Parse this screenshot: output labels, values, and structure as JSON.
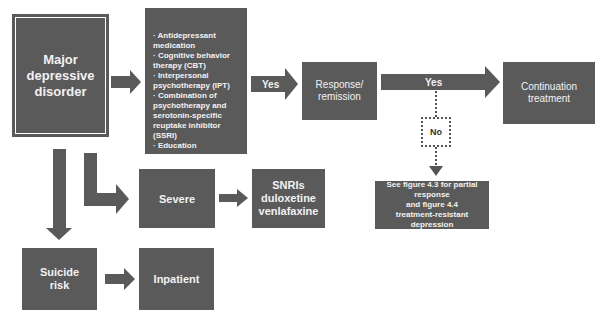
{
  "diagram": {
    "nodes": {
      "major_depressive_disorder": {
        "lines": [
          "Major",
          "depressive",
          "disorder"
        ]
      },
      "treatment_options": {
        "items": [
          "Antidepressant medication",
          "Cognitive behavior therapy (CBT)",
          "Interpersonal psychotherapy (IPT)",
          "Combination of psychotherapy and serotonin-specific reuptake inhibitor (SSRI)",
          "Education"
        ]
      },
      "response_remission": {
        "lines": [
          "Response/",
          "remission"
        ]
      },
      "continuation_treatment": {
        "lines": [
          "Continuation",
          "treatment"
        ]
      },
      "severe": {
        "lines": [
          "Severe"
        ]
      },
      "snris": {
        "lines": [
          "SNRIs",
          "duloxetine",
          "venlafaxine"
        ]
      },
      "suicide_risk": {
        "lines": [
          "Suicide",
          "risk"
        ]
      },
      "inpatient": {
        "lines": [
          "Inpatient"
        ]
      },
      "see_figures": {
        "lines": [
          "See figure 4.3 for partial response",
          "and figure 4.4",
          "treatment-resistant",
          "depression"
        ]
      }
    },
    "edge_labels": {
      "yes_1": "Yes",
      "yes_2": "Yes",
      "no": "No"
    }
  }
}
